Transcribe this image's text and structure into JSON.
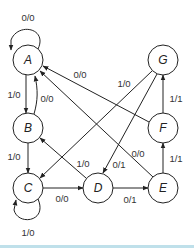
{
  "diagram": {
    "type": "state-diagram",
    "nodes": [
      {
        "id": "A",
        "label": "A",
        "x": 28,
        "y": 60
      },
      {
        "id": "B",
        "label": "B",
        "x": 28,
        "y": 128
      },
      {
        "id": "C",
        "label": "C",
        "x": 28,
        "y": 188
      },
      {
        "id": "D",
        "label": "D",
        "x": 98,
        "y": 188
      },
      {
        "id": "E",
        "label": "E",
        "x": 163,
        "y": 188
      },
      {
        "id": "F",
        "label": "F",
        "x": 163,
        "y": 128
      },
      {
        "id": "G",
        "label": "G",
        "x": 163,
        "y": 60
      }
    ],
    "edges": [
      {
        "from": "A",
        "to": "A",
        "label": "0/0"
      },
      {
        "from": "A",
        "to": "B",
        "label": "1/0"
      },
      {
        "from": "B",
        "to": "A",
        "label": "0/0"
      },
      {
        "from": "B",
        "to": "C",
        "label": "1/0"
      },
      {
        "from": "C",
        "to": "C",
        "label": "1/0"
      },
      {
        "from": "C",
        "to": "D",
        "label": "0/0"
      },
      {
        "from": "D",
        "to": "E",
        "label": "0/1"
      },
      {
        "from": "E",
        "to": "F",
        "label": "1/1"
      },
      {
        "from": "F",
        "to": "G",
        "label": "1/1"
      },
      {
        "from": "F",
        "to": "A",
        "label": "0/0"
      },
      {
        "from": "E",
        "to": "A",
        "label": "0/0"
      },
      {
        "from": "D",
        "to": "B",
        "label": "1/0"
      },
      {
        "from": "G",
        "to": "C",
        "label": "1/0"
      },
      {
        "from": "G",
        "to": "D",
        "label": "0/1"
      }
    ],
    "colors": {
      "stroke": "#222222",
      "bottom_rule": "#bfe0ea"
    }
  }
}
